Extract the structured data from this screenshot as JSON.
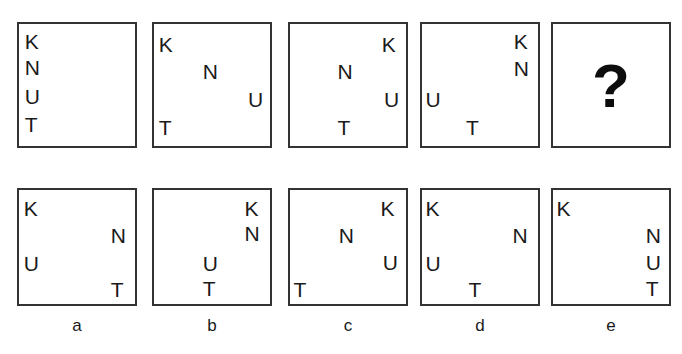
{
  "figure": {
    "type": "visual-analogy-matrix-puzzle",
    "letters": [
      "K",
      "N",
      "U",
      "T"
    ],
    "question_mark": "?",
    "stimulus_row": {
      "name": "stimulus-sequence",
      "boxes": [
        {
          "id": "stimulus-1",
          "glyphs": [
            {
              "char": "K",
              "x": 5,
              "y": 6
            },
            {
              "char": "N",
              "x": 5,
              "y": 27
            },
            {
              "char": "U",
              "x": 5,
              "y": 51
            },
            {
              "char": "T",
              "x": 5,
              "y": 74
            }
          ]
        },
        {
          "id": "stimulus-2",
          "glyphs": [
            {
              "char": "K",
              "x": 4,
              "y": 8
            },
            {
              "char": "N",
              "x": 42,
              "y": 30
            },
            {
              "char": "U",
              "x": 81,
              "y": 53
            },
            {
              "char": "T",
              "x": 4,
              "y": 76
            }
          ]
        },
        {
          "id": "stimulus-3",
          "glyphs": [
            {
              "char": "K",
              "x": 79,
              "y": 8
            },
            {
              "char": "N",
              "x": 41,
              "y": 30
            },
            {
              "char": "U",
              "x": 81,
              "y": 53
            },
            {
              "char": "T",
              "x": 41,
              "y": 76
            }
          ]
        },
        {
          "id": "stimulus-4",
          "glyphs": [
            {
              "char": "K",
              "x": 79,
              "y": 6
            },
            {
              "char": "N",
              "x": 79,
              "y": 28
            },
            {
              "char": "U",
              "x": 3,
              "y": 53
            },
            {
              "char": "T",
              "x": 38,
              "y": 76
            }
          ]
        },
        {
          "id": "stimulus-5-unknown",
          "glyphs": [],
          "question": "?"
        }
      ]
    },
    "answer_row": {
      "name": "answer-options",
      "boxes": [
        {
          "id": "option-a",
          "label": "a",
          "glyphs": [
            {
              "char": "K",
              "x": 4,
              "y": 7
            },
            {
              "char": "N",
              "x": 79,
              "y": 31
            },
            {
              "char": "U",
              "x": 4,
              "y": 55
            },
            {
              "char": "T",
              "x": 79,
              "y": 78
            }
          ]
        },
        {
          "id": "option-b",
          "label": "b",
          "glyphs": [
            {
              "char": "K",
              "x": 78,
              "y": 7
            },
            {
              "char": "N",
              "x": 78,
              "y": 29
            },
            {
              "char": "U",
              "x": 42,
              "y": 55
            },
            {
              "char": "T",
              "x": 42,
              "y": 77
            }
          ]
        },
        {
          "id": "option-c",
          "label": "c",
          "glyphs": [
            {
              "char": "K",
              "x": 78,
              "y": 7
            },
            {
              "char": "N",
              "x": 42,
              "y": 31
            },
            {
              "char": "U",
              "x": 80,
              "y": 54
            },
            {
              "char": "T",
              "x": 3,
              "y": 78
            }
          ]
        },
        {
          "id": "option-d",
          "label": "d",
          "glyphs": [
            {
              "char": "K",
              "x": 3,
              "y": 7
            },
            {
              "char": "N",
              "x": 78,
              "y": 31
            },
            {
              "char": "U",
              "x": 3,
              "y": 55
            },
            {
              "char": "T",
              "x": 40,
              "y": 78
            }
          ]
        },
        {
          "id": "option-e",
          "label": "e",
          "glyphs": [
            {
              "char": "K",
              "x": 3,
              "y": 7
            },
            {
              "char": "N",
              "x": 80,
              "y": 31
            },
            {
              "char": "U",
              "x": 80,
              "y": 54
            },
            {
              "char": "T",
              "x": 80,
              "y": 77
            }
          ]
        }
      ]
    },
    "geometry": {
      "box_width": 120,
      "top_box_height": 126,
      "bottom_box_height": 118,
      "column_left_positions": [
        17,
        152,
        288,
        420,
        551
      ]
    },
    "colors": {
      "background": "#ffffff",
      "border": "#333333",
      "text": "#1a1a1a",
      "question_mark": "#0d0d0d"
    }
  }
}
